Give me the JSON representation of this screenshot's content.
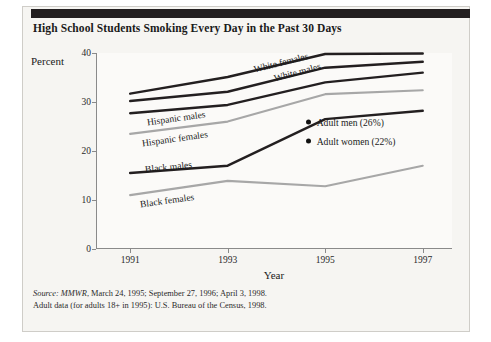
{
  "figure": {
    "title": "High School Students Smoking Every Day in the Past 30 Days",
    "ylabel": "Percent",
    "xlabel": "Year"
  },
  "notes": {
    "line1_prefix": "Source:",
    "line1_italic": "MMWR",
    "line1_rest": ", March 24, 1995; September 27, 1996; April 3, 1998.",
    "line2": "Adult data (for adults 18+ in 1995): U.S. Bureau of the Census, 1998."
  },
  "annotations": [
    {
      "label": "Adult men (26%)",
      "value": 26
    },
    {
      "label": "Adult women (22%)",
      "value": 22
    }
  ],
  "colors": {
    "dark_line": "#231f20",
    "gray_line": "#a7a7a7",
    "axis": "#8a8a8a",
    "bar": "#231f20",
    "card": "#f6f5f2"
  },
  "chart_data": {
    "type": "line",
    "title": "High School Students Smoking Every Day in the Past 30 Days",
    "xlabel": "Year",
    "ylabel": "Percent",
    "x": [
      1991,
      1993,
      1995,
      1997
    ],
    "xtick_labels": [
      "1991",
      "1993",
      "1995",
      "1997"
    ],
    "ytick_labels": [
      "0",
      "10",
      "20",
      "30",
      "40"
    ],
    "yticks": [
      0,
      10,
      20,
      40
    ],
    "ylim": [
      0,
      40
    ],
    "xlim": [
      1990.3,
      1997.6
    ],
    "grid": false,
    "legend": "inline-labels",
    "series": [
      {
        "name": "White females",
        "values": [
          31.7,
          35.1,
          39.8,
          39.9
        ],
        "color": "#231f20",
        "style": "dark"
      },
      {
        "name": "White males",
        "values": [
          30.2,
          32.1,
          37.0,
          38.2
        ],
        "color": "#231f20",
        "style": "dark"
      },
      {
        "name": "Hispanic males",
        "values": [
          27.7,
          29.4,
          34.0,
          36.0
        ],
        "color": "#231f20",
        "style": "dark"
      },
      {
        "name": "Hispanic females",
        "values": [
          23.5,
          26.0,
          31.6,
          32.4
        ],
        "color": "#a7a7a7",
        "style": "gray"
      },
      {
        "name": "Black males",
        "values": [
          15.5,
          17.0,
          26.5,
          28.2
        ],
        "color": "#231f20",
        "style": "dark"
      },
      {
        "name": "Black females",
        "values": [
          11.0,
          13.9,
          12.8,
          17.0
        ],
        "color": "#a7a7a7",
        "style": "gray"
      }
    ],
    "annotations": [
      {
        "text": "Adult men (26%)",
        "value": 26
      },
      {
        "text": "Adult women (22%)",
        "value": 22
      }
    ]
  }
}
